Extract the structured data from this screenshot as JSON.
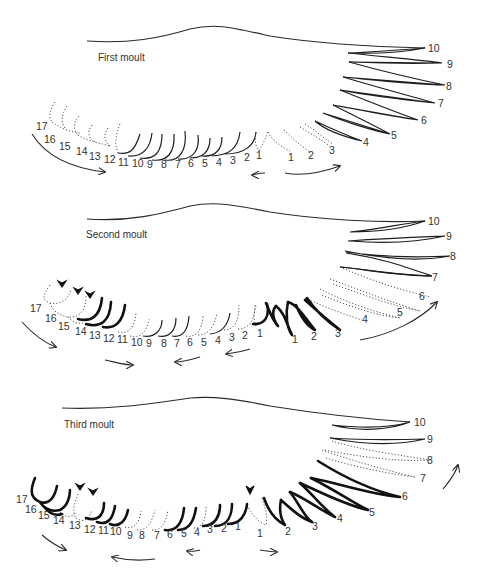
{
  "panels": [
    {
      "title": "First moult",
      "primaries": [
        "1",
        "2",
        "3",
        "4",
        "5",
        "6",
        "7",
        "8",
        "9",
        "10"
      ],
      "secondaries": [
        "1",
        "2",
        "3",
        "4",
        "5",
        "6",
        "7",
        "8",
        "9",
        "10",
        "11",
        "12",
        "13",
        "14",
        "15",
        "16",
        "17"
      ]
    },
    {
      "title": "Second moult",
      "primaries": [
        "1",
        "2",
        "3",
        "4",
        "5",
        "6",
        "7",
        "8",
        "9",
        "10"
      ],
      "secondaries": [
        "1",
        "2",
        "3",
        "4",
        "5",
        "6",
        "7",
        "8",
        "9",
        "10",
        "11",
        "12",
        "13",
        "14",
        "15",
        "16",
        "17"
      ]
    },
    {
      "title": "Third moult",
      "primaries": [
        "1",
        "2",
        "3",
        "4",
        "5",
        "6",
        "7",
        "8",
        "9",
        "10"
      ],
      "secondaries": [
        "1",
        "2",
        "3",
        "4",
        "5",
        "6",
        "7",
        "8",
        "9",
        "10",
        "11",
        "12",
        "13",
        "14",
        "15",
        "16",
        "17"
      ]
    }
  ],
  "legend": {
    "dotted": "feather missing / growing",
    "solid": "old feather",
    "bold": "new feather",
    "arrowhead": "moult centre"
  }
}
